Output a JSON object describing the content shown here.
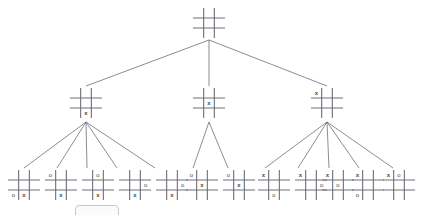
{
  "diagram": {
    "type": "game-tree",
    "line_color": "#5a5a66",
    "grid_color": "#6e6e78",
    "mark_color": "#4a4a4a",
    "background": "#ffffff",
    "mark_x": "x",
    "mark_o": "o"
  },
  "levels": [
    {
      "level": 0,
      "label": "root",
      "nodes": [
        {
          "id": "root",
          "name": "root-empty-board",
          "x": 193,
          "y": 8,
          "w": 32,
          "h": 30,
          "cells": [
            "",
            "",
            "",
            "",
            "",
            "",
            "",
            "",
            ""
          ]
        }
      ]
    },
    {
      "level": 1,
      "label": "x-first-moves",
      "nodes": [
        {
          "id": "L1-A",
          "name": "x-bottom-center",
          "x": 70,
          "y": 88,
          "w": 32,
          "h": 30,
          "cells": [
            "",
            "",
            "",
            "",
            "",
            "",
            "",
            "x",
            ""
          ]
        },
        {
          "id": "L1-B",
          "name": "x-center",
          "x": 193,
          "y": 88,
          "w": 32,
          "h": 30,
          "cells": [
            "",
            "",
            "",
            "",
            "x",
            "",
            "",
            "",
            ""
          ]
        },
        {
          "id": "L1-C",
          "name": "x-top-left",
          "x": 311,
          "y": 88,
          "w": 32,
          "h": 30,
          "cells": [
            "x",
            "",
            "",
            "",
            "",
            "",
            "",
            "",
            ""
          ]
        }
      ]
    },
    {
      "level": 2,
      "label": "o-replies",
      "nodes": [
        {
          "id": "L2-A1",
          "name": "o-bottom-left-x-bottom-center",
          "parent": "L1-A",
          "x": 8,
          "y": 170,
          "w": 32,
          "h": 30,
          "cells": [
            "",
            "",
            "",
            "",
            "",
            "",
            "o",
            "x",
            ""
          ]
        },
        {
          "id": "L2-A2",
          "name": "o-top-left-x-bottom-center",
          "parent": "L1-A",
          "x": 45,
          "y": 170,
          "w": 32,
          "h": 30,
          "cells": [
            "o",
            "",
            "",
            "",
            "",
            "",
            "",
            "x",
            ""
          ]
        },
        {
          "id": "L2-A3",
          "name": "o-top-center-x-bottom-center",
          "parent": "L1-A",
          "x": 82,
          "y": 170,
          "w": 32,
          "h": 30,
          "cells": [
            "",
            "o",
            "",
            "",
            "",
            "",
            "",
            "x",
            ""
          ]
        },
        {
          "id": "L2-A4",
          "name": "o-middle-right-x-bottom-center",
          "parent": "L1-A",
          "x": 119,
          "y": 170,
          "w": 32,
          "h": 30,
          "cells": [
            "",
            "",
            "",
            "",
            "",
            "o",
            "",
            "x",
            ""
          ]
        },
        {
          "id": "L2-A5",
          "name": "o-middle-right-alt-x-bottom-center",
          "parent": "L1-A",
          "x": 156,
          "y": 170,
          "w": 32,
          "h": 30,
          "cells": [
            "",
            "",
            "",
            "",
            "",
            "o",
            "",
            "x",
            ""
          ]
        },
        {
          "id": "L2-B1",
          "name": "o-top-left-x-center",
          "parent": "L1-B",
          "x": 186,
          "y": 170,
          "w": 32,
          "h": 30,
          "cells": [
            "o",
            "",
            "",
            "",
            "x",
            "",
            "",
            "",
            ""
          ]
        },
        {
          "id": "L2-B2",
          "name": "o-top-left-alt-x-center",
          "parent": "L1-B",
          "x": 223,
          "y": 170,
          "w": 32,
          "h": 30,
          "cells": [
            "o",
            "",
            "",
            "",
            "x",
            "",
            "",
            "",
            ""
          ]
        },
        {
          "id": "L2-C1",
          "name": "x-top-left-o-bottom-center",
          "parent": "L1-C",
          "x": 258,
          "y": 170,
          "w": 32,
          "h": 30,
          "cells": [
            "x",
            "",
            "",
            "",
            "",
            "",
            "",
            "o",
            ""
          ]
        },
        {
          "id": "L2-C2",
          "name": "x-top-left-o-middle-right",
          "parent": "L1-C",
          "x": 295,
          "y": 170,
          "w": 32,
          "h": 30,
          "cells": [
            "x",
            "",
            "",
            "",
            "",
            "o",
            "",
            "",
            ""
          ]
        },
        {
          "id": "L2-C3",
          "name": "x-top-left-o-center",
          "parent": "L1-C",
          "x": 322,
          "y": 170,
          "w": 32,
          "h": 30,
          "cells": [
            "x",
            "",
            "",
            "",
            "o",
            "",
            "",
            "",
            ""
          ]
        },
        {
          "id": "L2-C4",
          "name": "x-top-left-o-bottom-left",
          "parent": "L1-C",
          "x": 352,
          "y": 170,
          "w": 32,
          "h": 30,
          "cells": [
            "x",
            "",
            "",
            "",
            "",
            "",
            "o",
            "",
            ""
          ]
        },
        {
          "id": "L2-C5",
          "name": "x-top-left-o-top-center",
          "parent": "L1-C",
          "x": 383,
          "y": 170,
          "w": 32,
          "h": 30,
          "cells": [
            "x",
            "o",
            "",
            "",
            "",
            "",
            "",
            "",
            ""
          ]
        }
      ]
    }
  ],
  "edges": [
    {
      "name": "edge-root-to-L1-A",
      "x1": 209,
      "y1": 40,
      "x2": 86,
      "y2": 86
    },
    {
      "name": "edge-root-to-L1-B",
      "x1": 209,
      "y1": 40,
      "x2": 209,
      "y2": 86
    },
    {
      "name": "edge-root-to-L1-C",
      "x1": 209,
      "y1": 40,
      "x2": 327,
      "y2": 86
    },
    {
      "name": "edge-L1-A-to-L2-A1",
      "x1": 86,
      "y1": 122,
      "x2": 24,
      "y2": 168
    },
    {
      "name": "edge-L1-A-to-L2-A2",
      "x1": 86,
      "y1": 122,
      "x2": 57,
      "y2": 168
    },
    {
      "name": "edge-L1-A-to-L2-A3",
      "x1": 86,
      "y1": 122,
      "x2": 87,
      "y2": 168
    },
    {
      "name": "edge-L1-A-to-L2-A4",
      "x1": 86,
      "y1": 122,
      "x2": 117,
      "y2": 168
    },
    {
      "name": "edge-L1-A-to-L2-A5",
      "x1": 86,
      "y1": 122,
      "x2": 155,
      "y2": 168
    },
    {
      "name": "edge-L1-B-to-L2-B1",
      "x1": 209,
      "y1": 122,
      "x2": 193,
      "y2": 168
    },
    {
      "name": "edge-L1-B-to-L2-B2",
      "x1": 209,
      "y1": 122,
      "x2": 228,
      "y2": 168
    },
    {
      "name": "edge-L1-C-to-L2-C1",
      "x1": 327,
      "y1": 122,
      "x2": 265,
      "y2": 168
    },
    {
      "name": "edge-L1-C-to-L2-C2",
      "x1": 327,
      "y1": 122,
      "x2": 298,
      "y2": 168
    },
    {
      "name": "edge-L1-C-to-L2-C3",
      "x1": 327,
      "y1": 122,
      "x2": 329,
      "y2": 168
    },
    {
      "name": "edge-L1-C-to-L2-C4",
      "x1": 327,
      "y1": 122,
      "x2": 359,
      "y2": 168
    },
    {
      "name": "edge-L1-C-to-L2-C5",
      "x1": 327,
      "y1": 122,
      "x2": 393,
      "y2": 168
    }
  ],
  "artifact": {
    "name": "bottom-partial-shape",
    "x": 75,
    "y": 205,
    "w": 42,
    "h": 12
  }
}
